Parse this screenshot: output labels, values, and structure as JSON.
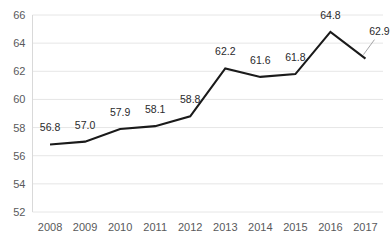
{
  "chart_data": {
    "type": "line",
    "title": "",
    "subtitle": "",
    "xlabel": "",
    "ylabel": "",
    "categories": [
      "2008",
      "2009",
      "2010",
      "2011",
      "2012",
      "2013",
      "2014",
      "2015",
      "2016",
      "2017"
    ],
    "values": [
      56.8,
      57.0,
      57.9,
      58.1,
      58.8,
      62.2,
      61.6,
      61.8,
      64.8,
      62.9
    ],
    "point_labels": [
      "56.8",
      "57.0",
      "57.9",
      "58.1",
      "58.8",
      "62.2",
      "61.6",
      "61.8",
      "64.8",
      "62.9"
    ],
    "ylim": [
      52,
      66
    ],
    "yticks": [
      66,
      64,
      62,
      60,
      58,
      56,
      54,
      52
    ],
    "ytick_labels": [
      "66",
      "64",
      "62",
      "60",
      "58",
      "56",
      "54",
      "52"
    ],
    "grid": {
      "horizontal": true,
      "vertical": false
    },
    "legend": {
      "visible": false,
      "position": "none"
    },
    "markers": false,
    "colors": {
      "line": "#1a1a1a",
      "gridline": "#e6e6e6",
      "axis": "#d9d9d9",
      "tick_label": "#59595b",
      "data_label": "#2a2a2c",
      "background": "#ffffff"
    },
    "line_width": 2.1,
    "label_offset_px": 13,
    "leader_lines": [
      {
        "index": 9,
        "label": "62.9"
      }
    ]
  }
}
